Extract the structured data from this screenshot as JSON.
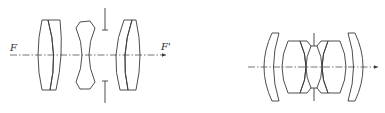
{
  "diagrams": [
    {
      "name": "triplet-lens-layout",
      "labels": {
        "front_focus": "F",
        "rear_focus": "F'"
      },
      "elements": [
        "cemented positive doublet",
        "biconcave negative element",
        "cemented positive doublet"
      ],
      "aperture_stop": "between element 2 and element 3"
    },
    {
      "name": "double-gauss-lens-layout",
      "elements": [
        "positive meniscus",
        "cemented doublet",
        "aperture stop",
        "cemented doublet",
        "positive meniscus"
      ],
      "aperture_stop": "center"
    }
  ],
  "colors": {
    "line": "#3a3a3a",
    "background": "#ffffff"
  }
}
